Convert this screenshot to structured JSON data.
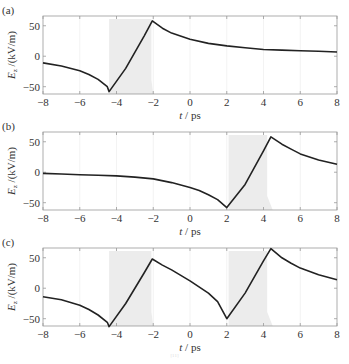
{
  "chart_data": [
    {
      "type": "line",
      "panel_label": "(a)",
      "xlabel": "t / ps",
      "ylabel": "E_z /(kV/m)",
      "ylabel_main": "E",
      "ylabel_sub": "z",
      "ylabel_rest": "/(kV/m)",
      "xlim": [
        -8,
        8
      ],
      "ylim": [
        -62,
        66
      ],
      "xticks": [
        -8,
        -6,
        -4,
        -2,
        0,
        2,
        4,
        6,
        8
      ],
      "yticks": [
        -50,
        0,
        50
      ],
      "grid": "faint vertical lines",
      "shaded_regions": [
        {
          "x_start": -4.4,
          "x_end": -2.1,
          "x_end_bottom": -2.0
        }
      ],
      "series": [
        {
          "name": "E_z",
          "x": [
            -8,
            -7,
            -6,
            -5.5,
            -5,
            -4.5,
            -4.4,
            -3.5,
            -2.5,
            -2.05,
            -1.5,
            -1,
            0,
            1,
            2,
            3,
            4,
            5,
            6,
            7,
            8
          ],
          "y": [
            -11,
            -16,
            -24,
            -30,
            -38,
            -50,
            -58,
            -20,
            33,
            58,
            46,
            38,
            28,
            21,
            17,
            14,
            11,
            10,
            9,
            8,
            7
          ]
        }
      ]
    },
    {
      "type": "line",
      "panel_label": "(b)",
      "xlabel": "t / ps",
      "ylabel": "E_z /(kV/m)",
      "ylabel_main": "E",
      "ylabel_sub": "z",
      "ylabel_rest": "/(kV/m)",
      "xlim": [
        -8,
        8
      ],
      "ylim": [
        -62,
        66
      ],
      "xticks": [
        -8,
        -6,
        -4,
        -2,
        0,
        2,
        4,
        6,
        8
      ],
      "yticks": [
        -50,
        0,
        50
      ],
      "grid": "faint vertical lines",
      "shaded_regions": [
        {
          "x_start": 2.1,
          "x_end": 4.2,
          "x_end_bottom": 4.5
        }
      ],
      "series": [
        {
          "name": "E_z",
          "x": [
            -8,
            -7,
            -6,
            -5,
            -4,
            -3,
            -2,
            -1,
            0,
            0.5,
            1,
            1.5,
            2,
            3,
            4,
            4.4,
            5,
            5.5,
            6,
            7,
            8
          ],
          "y": [
            -2,
            -3,
            -4,
            -5,
            -6,
            -8,
            -11,
            -17,
            -25,
            -30,
            -37,
            -45,
            -58,
            -20,
            35,
            58,
            46,
            38,
            30,
            20,
            13
          ]
        }
      ]
    },
    {
      "type": "line",
      "panel_label": "(c)",
      "xlabel": "t / ps",
      "ylabel": "E_z /(kV/m)",
      "ylabel_main": "E",
      "ylabel_sub": "z",
      "ylabel_rest": "/(kV/m)",
      "xlim": [
        -8,
        8
      ],
      "ylim": [
        -62,
        66
      ],
      "xticks": [
        -8,
        -6,
        -4,
        -2,
        0,
        2,
        4,
        6,
        8
      ],
      "yticks": [
        -50,
        0,
        50
      ],
      "grid": "faint vertical lines",
      "shaded_regions": [
        {
          "x_start": -4.4,
          "x_end": -2.1,
          "x_end_bottom": -2.0
        },
        {
          "x_start": 2.1,
          "x_end": 4.2,
          "x_end_bottom": 4.5
        }
      ],
      "series": [
        {
          "name": "E_z",
          "x": [
            -8,
            -7,
            -6,
            -5.5,
            -5,
            -4.5,
            -4.4,
            -3.5,
            -2.5,
            -2.05,
            -1.5,
            -1,
            0,
            1,
            1.5,
            2,
            3,
            4,
            4.4,
            5,
            5.5,
            6,
            7,
            8
          ],
          "y": [
            -14,
            -19,
            -28,
            -35,
            -44,
            -56,
            -63,
            -25,
            25,
            48,
            38,
            30,
            12,
            -8,
            -22,
            -50,
            -8,
            45,
            65,
            50,
            41,
            33,
            22,
            14
          ]
        }
      ]
    }
  ],
  "caption": {
    "text": "[11]"
  }
}
